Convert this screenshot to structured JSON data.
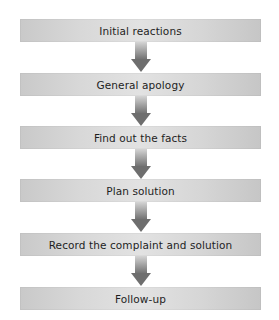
{
  "flowchart": {
    "steps": [
      {
        "label": "Initial reactions",
        "top": 19
      },
      {
        "label": "General apology",
        "top": 73
      },
      {
        "label": "Find out the facts",
        "top": 126
      },
      {
        "label": "Plan solution",
        "top": 179
      },
      {
        "label": "Record the complaint and solution",
        "top": 233
      },
      {
        "label": "Follow-up",
        "top": 287
      }
    ],
    "colors": {
      "box": "#d8d8d8",
      "arrow": "#6e6e6e",
      "text": "#1e1e1e"
    },
    "arrow_icon": "down-arrow-icon"
  }
}
